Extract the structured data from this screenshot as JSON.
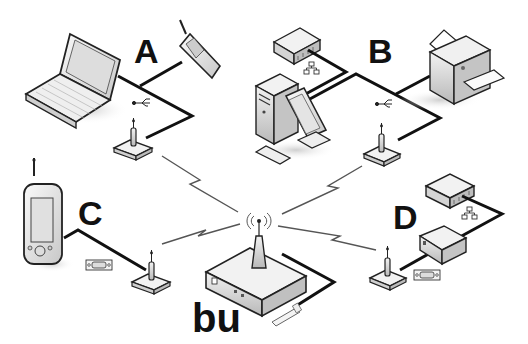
{
  "diagram": {
    "labels": {
      "a": "A",
      "b": "B",
      "c": "C",
      "d": "D",
      "base_unit": "bu"
    },
    "groups": [
      {
        "id": "A",
        "devices": [
          "laptop",
          "mobile-phone"
        ],
        "connection": "usb",
        "adapter": "wireless-adapter"
      },
      {
        "id": "B",
        "devices": [
          "network-hub",
          "desktop-computer",
          "printer"
        ],
        "connection": "usb",
        "adapter": "wireless-adapter"
      },
      {
        "id": "C",
        "devices": [
          "pda"
        ],
        "connection": "serial",
        "adapter": "wireless-adapter"
      },
      {
        "id": "D",
        "devices": [
          "network-hub",
          "device-box"
        ],
        "connection": "serial",
        "adapter": "wireless-adapter"
      }
    ],
    "base_unit": {
      "name": "bu",
      "connection": "wired",
      "plug": "power-plug"
    },
    "links": [
      "A-bu wireless",
      "B-bu wireless",
      "C-bu wireless",
      "D-bu wireless"
    ],
    "colors": {
      "line": "#111111",
      "device_fill": "#e8e8e8",
      "device_stroke": "#222222",
      "background": "#ffffff"
    }
  }
}
